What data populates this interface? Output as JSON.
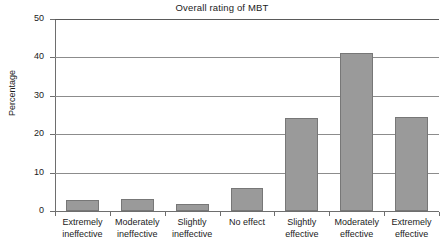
{
  "chart_data": {
    "type": "bar",
    "title": "Overall rating of MBT",
    "xlabel": "",
    "ylabel": "Percentage",
    "categories": [
      "Extremely ineffective",
      "Moderately ineffective",
      "Slightly ineffective",
      "No effect",
      "Slightly effective",
      "Moderately effective",
      "Extremely effective"
    ],
    "category_lines": [
      [
        "Extremely",
        "ineffective"
      ],
      [
        "Moderately",
        "ineffective"
      ],
      [
        "Slightly",
        "ineffective"
      ],
      [
        "No effect",
        ""
      ],
      [
        "Slightly",
        "effective"
      ],
      [
        "Moderately",
        "effective"
      ],
      [
        "Extremely",
        "effective"
      ]
    ],
    "values": [
      2.9,
      3.1,
      1.8,
      6.0,
      24.2,
      41.2,
      24.5
    ],
    "ylim": [
      0,
      50
    ],
    "yticks": [
      0,
      10,
      20,
      30,
      40,
      50
    ],
    "ytick_labels": [
      "0",
      "10",
      "20",
      "30",
      "40",
      "50"
    ],
    "grid": true,
    "grid_axis": "y",
    "legend": "none",
    "bar_color": "#9a9a9a",
    "bar_edge_color": "#777777",
    "axis_color": "#6e6e6e",
    "grid_color": "#8c8c8c",
    "background": "#ffffff"
  }
}
